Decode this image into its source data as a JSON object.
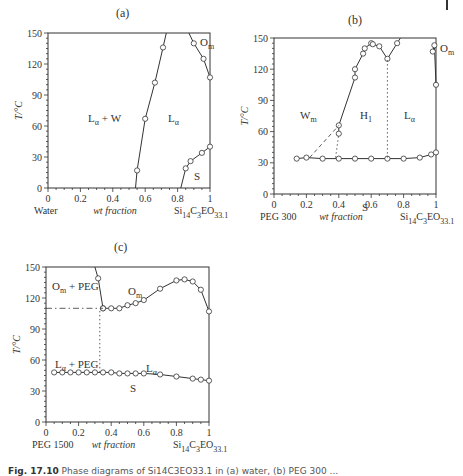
{
  "figure": {
    "caption_label": "Fig. 17.10",
    "caption_text": "Phase diagrams of Si14C3EO33.1 in (a) water, (b) PEG 300 ..."
  },
  "panels": [
    {
      "id": "a",
      "title": "(a)",
      "xlabel_left": "Water",
      "xlabel_mid": "wt fraction",
      "xlabel_right": "Si14C3EO33.1",
      "ylabel": "T/°C",
      "regions": [
        "Lα + W",
        "Lα",
        "Om",
        "S"
      ]
    },
    {
      "id": "b",
      "title": "(b)",
      "xlabel_left": "PEG 300",
      "xlabel_mid": "wt fraction",
      "xlabel_right": "Si14C3EO33.1",
      "ylabel": "T/°C",
      "regions": [
        "Wm",
        "H1",
        "Lα",
        "Om",
        "S"
      ]
    },
    {
      "id": "c",
      "title": "(c)",
      "xlabel_left": "PEG 1500",
      "xlabel_mid": "wt fraction",
      "xlabel_right": "Si14C3EO33.1",
      "ylabel": "T/°C",
      "regions": [
        "Om + PEG",
        "Om",
        "Lα + PEG",
        "Lα",
        "S"
      ]
    }
  ],
  "chart_data": [
    {
      "type": "line",
      "title": "(a)",
      "xlabel": "wt fraction (Water → Si14C3EO33.1)",
      "ylabel": "T/°C",
      "xlim": [
        0,
        1
      ],
      "ylim": [
        0,
        150
      ],
      "xticks": [
        0,
        0.2,
        0.4,
        0.6,
        0.8,
        1
      ],
      "yticks": [
        0,
        30,
        60,
        90,
        120,
        150
      ],
      "series": [
        {
          "name": "Lα+W / Lα boundary",
          "x": [
            0.54,
            0.55,
            0.6,
            0.66,
            0.71,
            0.73
          ],
          "y": [
            0,
            17,
            67,
            102,
            136,
            150
          ]
        },
        {
          "name": "Lα / Om boundary",
          "x": [
            0.87,
            0.9,
            0.96,
            1.0
          ],
          "y": [
            150,
            140,
            125,
            107
          ]
        },
        {
          "name": "S boundary",
          "x": [
            0.82,
            0.85,
            0.88,
            0.95,
            1.0
          ],
          "y": [
            0,
            19,
            26,
            34,
            40
          ]
        }
      ],
      "region_labels": [
        "Lα + W",
        "Lα",
        "Om",
        "S"
      ],
      "grid": false
    },
    {
      "type": "line",
      "title": "(b)",
      "xlabel": "wt fraction (PEG 300 → Si14C3EO33.1)",
      "ylabel": "T/°C",
      "xlim": [
        0,
        1
      ],
      "ylim": [
        0,
        150
      ],
      "xticks": [
        0,
        0.2,
        0.4,
        0.6,
        0.8,
        1
      ],
      "yticks": [
        0,
        30,
        60,
        90,
        120,
        150
      ],
      "series": [
        {
          "name": "Wm / H1 upper boundary",
          "x": [
            0.4,
            0.4,
            0.5,
            0.5,
            0.55,
            0.56,
            0.6,
            0.61,
            0.65,
            0.7,
            0.76,
            0.78
          ],
          "y": [
            58,
            66,
            112,
            120,
            135,
            140,
            145,
            144,
            142,
            130,
            145,
            150
          ]
        },
        {
          "name": "Om boundary",
          "x": [
            0.98,
            0.99,
            1.0
          ],
          "y": [
            137,
            143,
            105
          ]
        },
        {
          "name": "S line",
          "x": [
            0.14,
            0.2,
            0.3,
            0.4,
            0.5,
            0.6,
            0.7,
            0.8,
            0.9,
            0.97,
            1.0
          ],
          "y": [
            34,
            35,
            34,
            34,
            34,
            34,
            34,
            34,
            35,
            38,
            40
          ]
        },
        {
          "name": "dashed Wm boundary",
          "x": [
            0.22,
            0.4
          ],
          "y": [
            35,
            66
          ]
        },
        {
          "name": "dotted H1 boundary",
          "x": [
            0.38,
            0.4
          ],
          "y": [
            35,
            58
          ]
        },
        {
          "name": "dotted H1/Lα boundary",
          "x": [
            0.7,
            0.7
          ],
          "y": [
            35,
            130
          ]
        }
      ],
      "region_labels": [
        "Wm",
        "H1",
        "Lα",
        "Om",
        "S"
      ],
      "grid": false
    },
    {
      "type": "line",
      "title": "(c)",
      "xlabel": "wt fraction (PEG 1500 → Si14C3EO33.1)",
      "ylabel": "T/°C",
      "xlim": [
        0,
        1
      ],
      "ylim": [
        0,
        150
      ],
      "xticks": [
        0,
        0.2,
        0.4,
        0.6,
        0.8,
        1
      ],
      "yticks": [
        0,
        30,
        60,
        90,
        120,
        150
      ],
      "series": [
        {
          "name": "Om+PEG boundary",
          "x": [
            0.3,
            0.32,
            0.35
          ],
          "y": [
            150,
            139,
            110
          ]
        },
        {
          "name": "Om / Lα boundary",
          "x": [
            0.35,
            0.4,
            0.45,
            0.5,
            0.55,
            0.6,
            0.7,
            0.8,
            0.85,
            0.9,
            0.95,
            1.0
          ],
          "y": [
            110,
            110,
            110,
            113,
            115,
            118,
            129,
            137,
            138,
            136,
            128,
            107
          ]
        },
        {
          "name": "S line",
          "x": [
            0.05,
            0.1,
            0.15,
            0.2,
            0.25,
            0.3,
            0.35,
            0.4,
            0.45,
            0.5,
            0.55,
            0.6,
            0.7,
            0.8,
            0.9,
            0.95,
            1.0
          ],
          "y": [
            48,
            48,
            48,
            48,
            48,
            48,
            48,
            48,
            47,
            47,
            47,
            47,
            46,
            44,
            42,
            41,
            40
          ]
        },
        {
          "name": "dash-dot horizontal",
          "x": [
            0.0,
            0.35
          ],
          "y": [
            110,
            110
          ]
        },
        {
          "name": "dotted vertical",
          "x": [
            0.33,
            0.33
          ],
          "y": [
            48,
            110
          ]
        }
      ],
      "region_labels": [
        "Om + PEG",
        "Om",
        "Lα + PEG",
        "Lα",
        "S"
      ],
      "grid": false
    }
  ]
}
